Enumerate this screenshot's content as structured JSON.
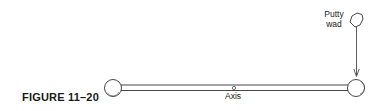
{
  "figure": {
    "caption": "FIGURE 11–20",
    "axis_label": "Axis",
    "putty_label_line1": "Putty",
    "putty_label_line2": "wad"
  },
  "elements": {
    "rod": "horizontal rod with spheres at both ends",
    "pivot": "small circle at rod center marking axis",
    "arrow": "downward arrow from putty wad to right sphere"
  },
  "colors": {
    "stroke": "#333333",
    "background": "#ffffff"
  }
}
